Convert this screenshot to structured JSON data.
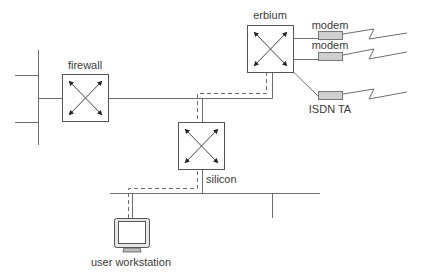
{
  "diagram": {
    "type": "network-topology",
    "nodes": {
      "firewall": {
        "label": "firewall",
        "kind": "router"
      },
      "erbium": {
        "label": "erbium",
        "kind": "router"
      },
      "silicon": {
        "label": "silicon",
        "kind": "router"
      },
      "workstation": {
        "label": "user workstation",
        "kind": "computer"
      }
    },
    "devices": {
      "modem1": {
        "label": "modem"
      },
      "modem2": {
        "label": "modem"
      },
      "isdn": {
        "label": "ISDN TA"
      }
    },
    "colors": {
      "line": "#6e6e6e",
      "box_stroke": "#555555",
      "device_fill": "#cfcfcf",
      "dashed_path": "#6e6e6e",
      "arrow": "#222222"
    },
    "edges": [
      "left-backbone — firewall",
      "firewall — erbium",
      "firewall/erbium segment — silicon",
      "silicon — bottom LAN",
      "bottom LAN — user workstation",
      "erbium — modem",
      "erbium — modem",
      "erbium — ISDN TA"
    ],
    "highlighted_path": "user workstation → silicon → erbium (dashed)"
  }
}
